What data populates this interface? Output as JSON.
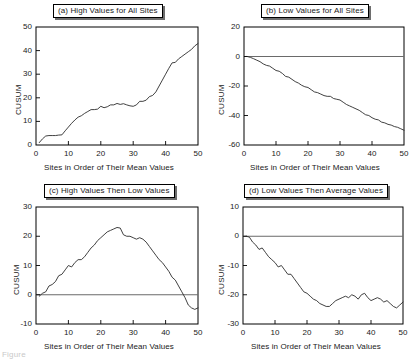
{
  "figure": {
    "caption_partial": "Figure",
    "shared_xlabel": "Sites in Order of Their Mean Values",
    "shared_ylabel": "CUSUM"
  },
  "chart_data": [
    {
      "id": "panel-a",
      "type": "line",
      "title": "(a) High Values for All Sites",
      "xlabel": "Sites in Order of Their Mean Values",
      "ylabel": "CUSUM",
      "xlim": [
        0,
        50
      ],
      "ylim": [
        0,
        50
      ],
      "xticks": [
        0,
        10,
        20,
        30,
        40,
        50
      ],
      "yticks": [
        0,
        10,
        20,
        30,
        40,
        50
      ],
      "grid": false,
      "legend": null,
      "zero_reference_line": false,
      "x": [
        1,
        2,
        3,
        4,
        5,
        6,
        7,
        8,
        9,
        10,
        11,
        12,
        13,
        14,
        15,
        16,
        17,
        18,
        19,
        20,
        21,
        22,
        23,
        24,
        25,
        26,
        27,
        28,
        29,
        30,
        31,
        32,
        33,
        34,
        35,
        36,
        37,
        38,
        39,
        40,
        41,
        42,
        43,
        44,
        45,
        46,
        47,
        48,
        49,
        50
      ],
      "values": [
        1.0,
        2.6,
        3.8,
        4.0,
        4.0,
        4.0,
        4.2,
        4.3,
        6.0,
        7.6,
        9.2,
        10.6,
        11.8,
        12.4,
        13.4,
        14.2,
        15.0,
        15.0,
        15.2,
        16.4,
        15.8,
        16.2,
        17.0,
        17.0,
        17.6,
        17.2,
        17.5,
        17.0,
        16.6,
        16.4,
        17.0,
        18.5,
        18.5,
        19.0,
        20.5,
        21.0,
        22.5,
        25.0,
        27.5,
        30.0,
        32.5,
        34.8,
        35.0,
        36.5,
        37.5,
        38.5,
        39.5,
        40.5,
        42.0,
        43.0
      ]
    },
    {
      "id": "panel-b",
      "type": "line",
      "title": "(b) Low Values for All Sites",
      "xlabel": "Sites in Order of Their Mean Values",
      "ylabel": "CUSUM",
      "xlim": [
        0,
        50
      ],
      "ylim": [
        -60,
        20
      ],
      "xticks": [
        0,
        10,
        20,
        30,
        40,
        50
      ],
      "yticks": [
        -60,
        -40,
        -20,
        0,
        20
      ],
      "grid": false,
      "legend": null,
      "zero_reference_line": true,
      "x": [
        1,
        2,
        3,
        4,
        5,
        6,
        7,
        8,
        9,
        10,
        11,
        12,
        13,
        14,
        15,
        16,
        17,
        18,
        19,
        20,
        21,
        22,
        23,
        24,
        25,
        26,
        27,
        28,
        29,
        30,
        31,
        32,
        33,
        34,
        35,
        36,
        37,
        38,
        39,
        40,
        41,
        42,
        43,
        44,
        45,
        46,
        47,
        48,
        49,
        50
      ],
      "values": [
        0.0,
        -0.6,
        -1.5,
        -2.5,
        -3.5,
        -5.0,
        -6.0,
        -6.5,
        -8.0,
        -9.5,
        -10.0,
        -11.5,
        -13.5,
        -14.0,
        -15.5,
        -17.0,
        -18.0,
        -19.5,
        -20.5,
        -21.0,
        -22.5,
        -24.0,
        -24.5,
        -25.5,
        -26.5,
        -27.0,
        -27.0,
        -28.5,
        -29.0,
        -29.5,
        -31.0,
        -32.5,
        -33.5,
        -34.5,
        -35.5,
        -36.5,
        -38.0,
        -39.5,
        -40.0,
        -41.5,
        -42.5,
        -43.0,
        -44.5,
        -45.0,
        -46.0,
        -46.5,
        -47.5,
        -48.0,
        -49.0,
        -50.0
      ]
    },
    {
      "id": "panel-c",
      "type": "line",
      "title": "(c) High Values Then Low Values",
      "xlabel": "Sites in Order of Their Mean Values",
      "ylabel": "CUSUM",
      "xlim": [
        0,
        50
      ],
      "ylim": [
        -10,
        30
      ],
      "xticks": [
        0,
        10,
        20,
        30,
        40,
        50
      ],
      "yticks": [
        -10,
        0,
        10,
        20,
        30
      ],
      "grid": false,
      "legend": null,
      "zero_reference_line": true,
      "x": [
        1,
        2,
        3,
        4,
        5,
        6,
        7,
        8,
        9,
        10,
        11,
        12,
        13,
        14,
        15,
        16,
        17,
        18,
        19,
        20,
        21,
        22,
        23,
        24,
        25,
        26,
        27,
        28,
        29,
        30,
        31,
        32,
        33,
        34,
        35,
        36,
        37,
        38,
        39,
        40,
        41,
        42,
        43,
        44,
        45,
        46,
        47,
        48,
        49,
        50
      ],
      "values": [
        -0.5,
        0.5,
        1.0,
        3.0,
        3.5,
        4.5,
        6.5,
        7.0,
        8.5,
        10.0,
        9.5,
        11.0,
        12.0,
        12.0,
        13.0,
        14.5,
        16.0,
        17.0,
        18.5,
        19.5,
        20.5,
        21.5,
        22.0,
        22.5,
        23.0,
        22.8,
        20.5,
        20.0,
        20.0,
        19.5,
        19.0,
        19.5,
        19.0,
        18.0,
        16.5,
        15.0,
        13.5,
        12.0,
        11.0,
        9.5,
        8.0,
        6.0,
        5.0,
        3.0,
        1.0,
        -1.0,
        -3.5,
        -4.5,
        -5.0,
        -4.5
      ]
    },
    {
      "id": "panel-d",
      "type": "line",
      "title": "(d) Low Values Then Average Values",
      "xlabel": "Sites in Order of Their Mean Values",
      "ylabel": "CUSUM",
      "xlim": [
        0,
        50
      ],
      "ylim": [
        -30,
        10
      ],
      "xticks": [
        0,
        10,
        20,
        30,
        40,
        50
      ],
      "yticks": [
        -30,
        -20,
        -10,
        0,
        10
      ],
      "grid": false,
      "legend": null,
      "zero_reference_line": true,
      "x": [
        1,
        2,
        3,
        4,
        5,
        6,
        7,
        8,
        9,
        10,
        11,
        12,
        13,
        14,
        15,
        16,
        17,
        18,
        19,
        20,
        21,
        22,
        23,
        24,
        25,
        26,
        27,
        28,
        29,
        30,
        31,
        32,
        33,
        34,
        35,
        36,
        37,
        38,
        39,
        40,
        41,
        42,
        43,
        44,
        45,
        46,
        47,
        48,
        49,
        50
      ],
      "values": [
        0.0,
        -0.3,
        -2.0,
        -3.0,
        -4.5,
        -4.0,
        -5.5,
        -7.0,
        -8.0,
        -9.0,
        -10.5,
        -10.0,
        -11.5,
        -13.0,
        -13.0,
        -14.5,
        -16.0,
        -17.5,
        -19.0,
        -19.5,
        -20.5,
        -21.5,
        -22.0,
        -23.0,
        -23.5,
        -24.0,
        -24.0,
        -23.0,
        -22.0,
        -21.5,
        -21.0,
        -20.5,
        -21.0,
        -20.0,
        -20.5,
        -21.5,
        -20.0,
        -19.5,
        -21.0,
        -22.0,
        -21.5,
        -21.0,
        -21.5,
        -22.5,
        -22.0,
        -23.0,
        -24.0,
        -24.5,
        -23.5,
        -22.5
      ]
    }
  ]
}
